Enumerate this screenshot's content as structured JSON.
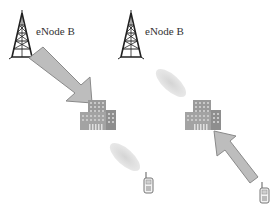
{
  "diagram": {
    "left_panel": {
      "tower_label": "eNode B",
      "arrow_direction": "tower-to-building"
    },
    "right_panel": {
      "tower_label": "eNode B",
      "arrow_direction": "phone-to-building"
    },
    "colors": {
      "tower": "#222222",
      "arrow_fill": "#bdbdbd",
      "arrow_stroke": "#8a8a8a",
      "building": "#9a9a9a",
      "ellipse": "#d8d8d8",
      "phone": "#777777"
    }
  }
}
